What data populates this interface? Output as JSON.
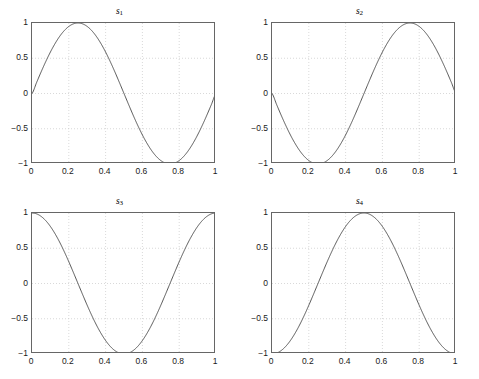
{
  "figure": {
    "background_color": "#ffffff",
    "rows": 2,
    "cols": 2,
    "axis_color": "#666666",
    "grid_color": "#bfbfbf",
    "curve_color": "#3a3a3a"
  },
  "chart_data": [
    {
      "type": "line",
      "title": "s_1",
      "title_base": "s",
      "title_sub": "1",
      "xlabel": "",
      "ylabel": "",
      "xlim": [
        0,
        1
      ],
      "ylim": [
        -1,
        1
      ],
      "xticks": [
        0,
        0.2,
        0.4,
        0.6,
        0.8,
        1
      ],
      "xticklabels": [
        "0",
        "0.2",
        "0.4",
        "0.6",
        "0.8",
        "1"
      ],
      "yticks": [
        -1,
        -0.5,
        0,
        0.5,
        1
      ],
      "yticklabels": [
        "-1",
        "-0.5",
        "0",
        "0.5",
        "1"
      ],
      "grid": true,
      "legend": "none",
      "expression": "sin(2*pi*x)",
      "x": [
        0,
        0.025,
        0.05,
        0.075,
        0.1,
        0.125,
        0.15,
        0.175,
        0.2,
        0.225,
        0.25,
        0.275,
        0.3,
        0.325,
        0.35,
        0.375,
        0.4,
        0.425,
        0.45,
        0.475,
        0.5,
        0.525,
        0.55,
        0.575,
        0.6,
        0.625,
        0.65,
        0.675,
        0.7,
        0.725,
        0.75,
        0.775,
        0.8,
        0.825,
        0.85,
        0.875,
        0.9,
        0.925,
        0.95,
        0.975,
        1
      ],
      "values": [
        0.0,
        0.156,
        0.309,
        0.454,
        0.588,
        0.707,
        0.809,
        0.891,
        0.951,
        0.988,
        1.0,
        0.988,
        0.951,
        0.891,
        0.809,
        0.707,
        0.588,
        0.454,
        0.309,
        0.156,
        0.0,
        -0.156,
        -0.309,
        -0.454,
        -0.588,
        -0.707,
        -0.809,
        -0.891,
        -0.951,
        -0.988,
        -1.0,
        -0.988,
        -0.951,
        -0.891,
        -0.809,
        -0.707,
        -0.588,
        -0.454,
        -0.309,
        -0.156,
        0.0
      ]
    },
    {
      "type": "line",
      "title": "s_2",
      "title_base": "s",
      "title_sub": "2",
      "xlabel": "",
      "ylabel": "",
      "xlim": [
        0,
        1
      ],
      "ylim": [
        -1,
        1
      ],
      "xticks": [
        0,
        0.2,
        0.4,
        0.6,
        0.8,
        1
      ],
      "xticklabels": [
        "0",
        "0.2",
        "0.4",
        "0.6",
        "0.8",
        "1"
      ],
      "yticks": [
        -1,
        -0.5,
        0,
        0.5,
        1
      ],
      "yticklabels": [
        "-1",
        "-0.5",
        "0",
        "0.5",
        "1"
      ],
      "grid": true,
      "legend": "none",
      "expression": "-sin(2*pi*x)",
      "x": [
        0,
        0.025,
        0.05,
        0.075,
        0.1,
        0.125,
        0.15,
        0.175,
        0.2,
        0.225,
        0.25,
        0.275,
        0.3,
        0.325,
        0.35,
        0.375,
        0.4,
        0.425,
        0.45,
        0.475,
        0.5,
        0.525,
        0.55,
        0.575,
        0.6,
        0.625,
        0.65,
        0.675,
        0.7,
        0.725,
        0.75,
        0.775,
        0.8,
        0.825,
        0.85,
        0.875,
        0.9,
        0.925,
        0.95,
        0.975,
        1
      ],
      "values": [
        0.0,
        -0.156,
        -0.309,
        -0.454,
        -0.588,
        -0.707,
        -0.809,
        -0.891,
        -0.951,
        -0.988,
        -1.0,
        -0.988,
        -0.951,
        -0.891,
        -0.809,
        -0.707,
        -0.588,
        -0.454,
        -0.309,
        -0.156,
        0.0,
        0.156,
        0.309,
        0.454,
        0.588,
        0.707,
        0.809,
        0.891,
        0.951,
        0.988,
        1.0,
        0.988,
        0.951,
        0.891,
        0.809,
        0.707,
        0.588,
        0.454,
        0.309,
        0.156,
        0.0
      ]
    },
    {
      "type": "line",
      "title": "s_3",
      "title_base": "s",
      "title_sub": "3",
      "xlabel": "",
      "ylabel": "",
      "xlim": [
        0,
        1
      ],
      "ylim": [
        -1,
        1
      ],
      "xticks": [
        0,
        0.2,
        0.4,
        0.6,
        0.8,
        1
      ],
      "xticklabels": [
        "0",
        "0.2",
        "0.4",
        "0.6",
        "0.8",
        "1"
      ],
      "yticks": [
        -1,
        -0.5,
        0,
        0.5,
        1
      ],
      "yticklabels": [
        "-1",
        "-0.5",
        "0",
        "0.5",
        "1"
      ],
      "grid": true,
      "legend": "none",
      "expression": "cos(2*pi*x)",
      "x": [
        0,
        0.025,
        0.05,
        0.075,
        0.1,
        0.125,
        0.15,
        0.175,
        0.2,
        0.225,
        0.25,
        0.275,
        0.3,
        0.325,
        0.35,
        0.375,
        0.4,
        0.425,
        0.45,
        0.475,
        0.5,
        0.525,
        0.55,
        0.575,
        0.6,
        0.625,
        0.65,
        0.675,
        0.7,
        0.725,
        0.75,
        0.775,
        0.8,
        0.825,
        0.85,
        0.875,
        0.9,
        0.925,
        0.95,
        0.975,
        1
      ],
      "values": [
        1.0,
        0.988,
        0.951,
        0.891,
        0.809,
        0.707,
        0.588,
        0.454,
        0.309,
        0.156,
        0.0,
        -0.156,
        -0.309,
        -0.454,
        -0.588,
        -0.707,
        -0.809,
        -0.891,
        -0.951,
        -0.988,
        -1.0,
        -0.988,
        -0.951,
        -0.891,
        -0.809,
        -0.707,
        -0.588,
        -0.454,
        -0.309,
        -0.156,
        0.0,
        0.156,
        0.309,
        0.454,
        0.588,
        0.707,
        0.809,
        0.891,
        0.951,
        0.988,
        1.0
      ]
    },
    {
      "type": "line",
      "title": "s_4",
      "title_base": "s",
      "title_sub": "4",
      "xlabel": "",
      "ylabel": "",
      "xlim": [
        0,
        1
      ],
      "ylim": [
        -1,
        1
      ],
      "xticks": [
        0,
        0.2,
        0.4,
        0.6,
        0.8,
        1
      ],
      "xticklabels": [
        "0",
        "0.2",
        "0.4",
        "0.6",
        "0.8",
        "1"
      ],
      "yticks": [
        -1,
        -0.5,
        0,
        0.5,
        1
      ],
      "yticklabels": [
        "-1",
        "-0.5",
        "0",
        "0.5",
        "1"
      ],
      "grid": true,
      "legend": "none",
      "expression": "-cos(2*pi*x)",
      "x": [
        0,
        0.025,
        0.05,
        0.075,
        0.1,
        0.125,
        0.15,
        0.175,
        0.2,
        0.225,
        0.25,
        0.275,
        0.3,
        0.325,
        0.35,
        0.375,
        0.4,
        0.425,
        0.45,
        0.475,
        0.5,
        0.525,
        0.55,
        0.575,
        0.6,
        0.625,
        0.65,
        0.675,
        0.7,
        0.725,
        0.75,
        0.775,
        0.8,
        0.825,
        0.85,
        0.875,
        0.9,
        0.925,
        0.95,
        0.975,
        1
      ],
      "values": [
        -1.0,
        -0.988,
        -0.951,
        -0.891,
        -0.809,
        -0.707,
        -0.588,
        -0.454,
        -0.309,
        -0.156,
        0.0,
        0.156,
        0.309,
        0.454,
        0.588,
        0.707,
        0.809,
        0.891,
        0.951,
        0.988,
        1.0,
        0.988,
        0.951,
        0.891,
        0.809,
        0.707,
        0.588,
        0.454,
        0.309,
        0.156,
        0.0,
        -0.156,
        -0.309,
        -0.454,
        -0.588,
        -0.707,
        -0.809,
        -0.891,
        -0.951,
        -0.988,
        -1.0
      ]
    }
  ]
}
